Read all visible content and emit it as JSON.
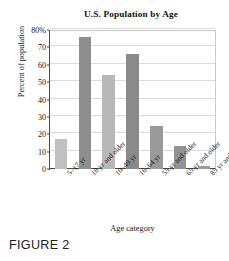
{
  "figure": {
    "caption": "FIGURE 2"
  },
  "chart_data": {
    "type": "bar",
    "title": "U.S. Population by Age",
    "xlabel": "Age category",
    "ylabel": "Percent of population",
    "categories": [
      "5–17 yr",
      "18 yr and older",
      "10–49 yr",
      "16–64 yr",
      "55 yr and older",
      "65 yr and older",
      "85 yr and older"
    ],
    "values": [
      17,
      76,
      54,
      66,
      25,
      13,
      2
    ],
    "ylim": [
      0,
      80
    ],
    "yticks": [
      0,
      10,
      20,
      30,
      40,
      50,
      60,
      70,
      80
    ],
    "ytick_labels": [
      "0",
      "10",
      "20",
      "30",
      "40",
      "50",
      "60",
      "70",
      "80%"
    ],
    "grid": true,
    "legend": "none",
    "bar_colors": [
      "#c0c0c0",
      "#8e8e8e",
      "#b8b8b8",
      "#8a8a8a",
      "#9a9a9a",
      "#939393",
      "#9a9a9a"
    ],
    "colors": {
      "light_bar": "#c0c0c0",
      "dark_bar": "#8e8e8e",
      "gridline": "#dcdcdc",
      "axis": "#4a4a4a",
      "background": "#ffffff",
      "text": "#161616"
    }
  }
}
